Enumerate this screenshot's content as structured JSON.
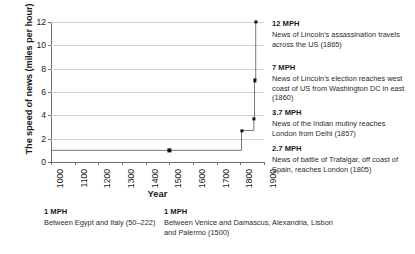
{
  "chart_data": {
    "type": "line",
    "title": "",
    "xlabel": "Year",
    "ylabel": "The speed of news (miles per hour)",
    "xlim": [
      1000,
      1900
    ],
    "ylim": [
      0,
      12
    ],
    "xticks": [
      "1000",
      "1100",
      "1200",
      "1300",
      "1400",
      "1500",
      "1600",
      "1700",
      "1800",
      "1900"
    ],
    "yticks": [
      "0",
      "2",
      "4",
      "6",
      "8",
      "10",
      "12"
    ],
    "grid": "horizontal",
    "legend": "none",
    "series": [
      {
        "name": "Speed of news",
        "style": "step-after",
        "x": [
          1000,
          1805,
          1857,
          1860,
          1865
        ],
        "values": [
          1,
          2.7,
          3.7,
          7,
          12
        ]
      }
    ],
    "points": [
      {
        "x": 1500,
        "y": 1,
        "label": "1 MPH"
      },
      {
        "x": 1805,
        "y": 2.7,
        "label": "2.7 MPH"
      },
      {
        "x": 1857,
        "y": 3.7,
        "label": "3.7 MPH"
      },
      {
        "x": 1860,
        "y": 7,
        "label": "7 MPH"
      },
      {
        "x": 1865,
        "y": 12,
        "label": "12 MPH"
      }
    ],
    "annotations_right": [
      {
        "head": "12 MPH",
        "body": "News of Lincoln's assassination travels across the US (1865)"
      },
      {
        "head": "7 MPH",
        "body": "News of Lincoln's election reaches west coast of US from Washington DC in east (1860)"
      },
      {
        "head": "3.7 MPH",
        "body": "News of the Indian mutiny reaches London from Delhi (1857)"
      },
      {
        "head": "2.7 MPH",
        "body": "News of battle of Trafalgar, off coast of Spain, reaches London (1805)"
      }
    ],
    "annotations_bottom": [
      {
        "head": "1 MPH",
        "body": "Between Egypt and Italy (50–222)"
      },
      {
        "head": "1 MPH",
        "body": "Between Venice and Damascus, Alexandria, Lisbon and Palermo (1500)"
      }
    ],
    "colors": {
      "line": "#555555",
      "marker": "#111111",
      "grid": "#d2d2d2",
      "axis": "#6e6e6e",
      "text": "#1a1a1a",
      "background": "#ffffff"
    }
  }
}
